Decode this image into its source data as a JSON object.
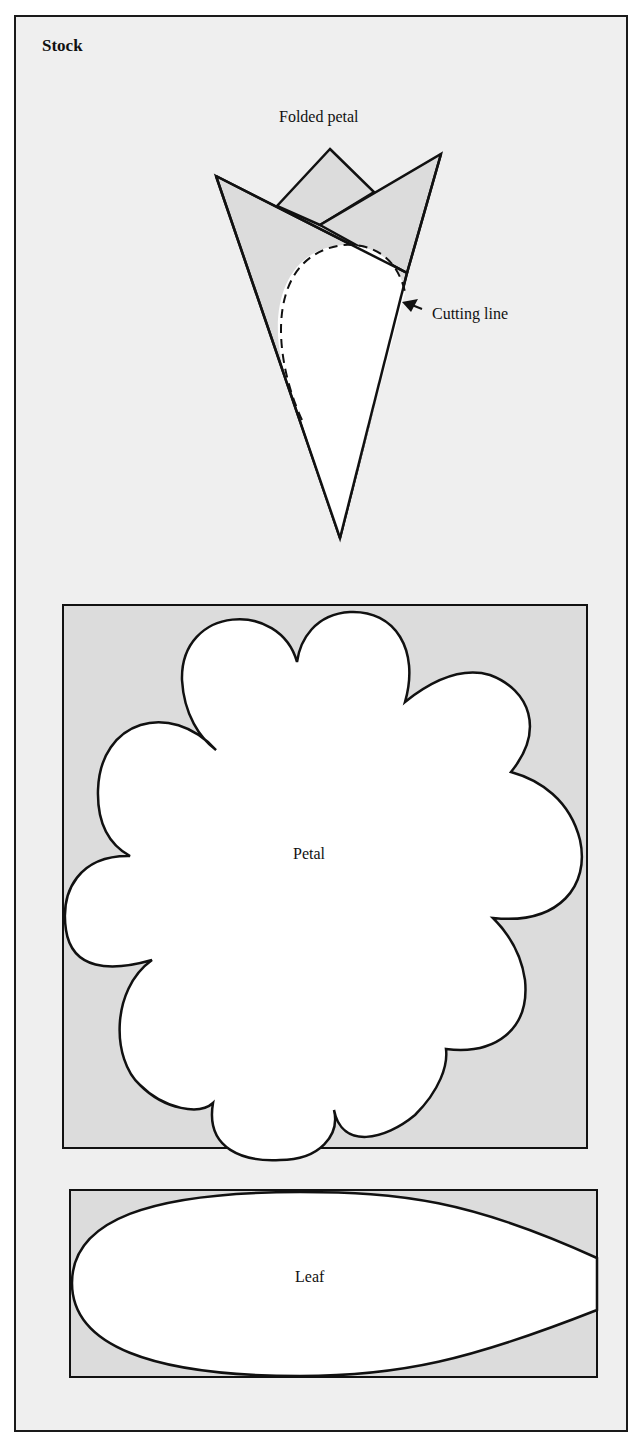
{
  "panel": {
    "title": "Stock"
  },
  "diagrams": {
    "folded_petal": {
      "label": "Folded petal",
      "callout": "Cutting line"
    },
    "petal": {
      "label": "Petal"
    },
    "leaf": {
      "label": "Leaf"
    }
  },
  "colors": {
    "background": "#efefef",
    "shape_fill_gray": "#dcdcdc",
    "cutout_fill": "#ffffff",
    "stroke": "#111111"
  }
}
